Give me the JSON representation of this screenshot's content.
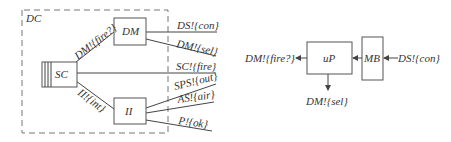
{
  "left_diagram": {
    "container_label": "DC",
    "nodes": {
      "sc": "SC",
      "dm": "DM",
      "ii": "II"
    },
    "edges": {
      "sc_dm": "DM!{fire?}",
      "sc_ii": "II!{int}"
    },
    "outputs": [
      "DS!{con}",
      "DM!{sel}",
      "SC!{fire}",
      "SPS!{out}",
      "AS!{air}",
      "P!{ok}"
    ]
  },
  "right_diagram": {
    "nodes": {
      "up": "uP",
      "mb": "MB"
    },
    "input": "DS!{con}",
    "outputs": {
      "left": "DM!{fire?}",
      "down": "DM!{sel}"
    }
  }
}
